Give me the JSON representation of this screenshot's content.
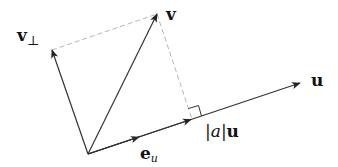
{
  "diagram": {
    "colors": {
      "vector": "#333333",
      "dashed": "#b5b5b5",
      "text": "#111111"
    },
    "points": {
      "origin": [
        88,
        154
      ],
      "v": [
        157,
        14
      ],
      "v_perp": [
        52,
        50
      ],
      "u": [
        300,
        83
      ],
      "projection": [
        192,
        119
      ],
      "e_u_head": [
        139,
        137
      ],
      "au_head": [
        190,
        119
      ]
    },
    "labels": {
      "v": "v",
      "v_perp_base": "v",
      "v_perp_sub": "⊥",
      "u": "u",
      "e_u_base": "e",
      "e_u_sub": "u",
      "au_bar_left": "|",
      "au_a": "a",
      "au_bar_right": "|",
      "au_u": "u"
    }
  }
}
